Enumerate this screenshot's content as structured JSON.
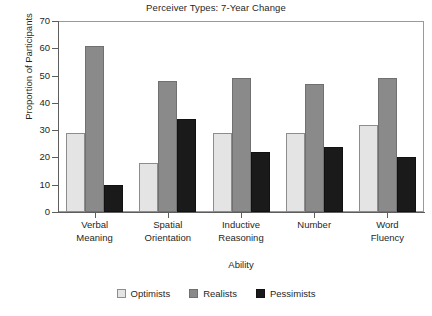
{
  "chart_data": {
    "type": "bar",
    "title": "Perceiver Types: 7-Year Change",
    "xlabel": "Ability",
    "ylabel": "Proportion of Participants",
    "categories": [
      "Verbal Meaning",
      "Spatial Orientation",
      "Inductive Reasoning",
      "Number",
      "Word Fluency"
    ],
    "category_lines": [
      [
        "Verbal",
        "Meaning"
      ],
      [
        "Spatial",
        "Orientation"
      ],
      [
        "Inductive",
        "Reasoning"
      ],
      [
        "Number",
        ""
      ],
      [
        "Word",
        "Fluency"
      ]
    ],
    "series": [
      {
        "name": "Optimists",
        "color": "#e4e4e4",
        "values": [
          29,
          18,
          29,
          29,
          32
        ]
      },
      {
        "name": "Realists",
        "color": "#8a8a8a",
        "values": [
          61,
          48,
          49,
          47,
          49
        ]
      },
      {
        "name": "Pessimists",
        "color": "#1a1a1a",
        "values": [
          10,
          34,
          22,
          24,
          20
        ]
      }
    ],
    "ylim": [
      0,
      70
    ],
    "ytick_step": 10,
    "yticks": [
      0,
      10,
      20,
      30,
      40,
      50,
      60,
      70
    ],
    "grid": false,
    "legend_position": "bottom",
    "frame": true,
    "background": "#ffffff",
    "axis_color": "#5d5d5d"
  }
}
